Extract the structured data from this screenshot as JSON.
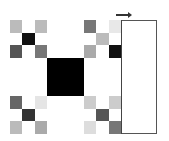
{
  "diagram": {
    "type": "fractal-grid",
    "grid_size": 9,
    "center_block": {
      "rows": [
        3,
        5
      ],
      "cols": [
        3,
        5
      ],
      "color": "#000000"
    },
    "cells": [
      [
        "#bbbbbb",
        "#ffffff",
        "#bbbbbb",
        "#ffffff",
        "#ffffff",
        "#ffffff",
        "#777777",
        "#ffffff",
        "#e8e8e8"
      ],
      [
        "#ffffff",
        "#111111",
        "#ffffff",
        "#ffffff",
        "#ffffff",
        "#ffffff",
        "#ffffff",
        "#bbbbbb",
        "#ffffff"
      ],
      [
        "#555555",
        "#ffffff",
        "#777777",
        "#ffffff",
        "#ffffff",
        "#ffffff",
        "#aaaaaa",
        "#ffffff",
        "#111111"
      ],
      [
        "#ffffff",
        "#ffffff",
        "#ffffff",
        "#000000",
        "#000000",
        "#000000",
        "#ffffff",
        "#ffffff",
        "#ffffff"
      ],
      [
        "#ffffff",
        "#ffffff",
        "#ffffff",
        "#000000",
        "#000000",
        "#000000",
        "#ffffff",
        "#ffffff",
        "#ffffff"
      ],
      [
        "#ffffff",
        "#ffffff",
        "#ffffff",
        "#000000",
        "#000000",
        "#000000",
        "#ffffff",
        "#ffffff",
        "#ffffff"
      ],
      [
        "#666666",
        "#ffffff",
        "#e5e5e5",
        "#ffffff",
        "#ffffff",
        "#ffffff",
        "#cccccc",
        "#ffffff",
        "#cccccc"
      ],
      [
        "#ffffff",
        "#333333",
        "#ffffff",
        "#ffffff",
        "#ffffff",
        "#ffffff",
        "#ffffff",
        "#555555",
        "#ffffff"
      ],
      [
        "#bbbbbb",
        "#ffffff",
        "#aaaaaa",
        "#ffffff",
        "#ffffff",
        "#ffffff",
        "#dddddd",
        "#ffffff",
        "#777777"
      ]
    ],
    "side_panel": {
      "color": "#ffffff"
    },
    "arrow": {
      "direction": "right"
    }
  }
}
